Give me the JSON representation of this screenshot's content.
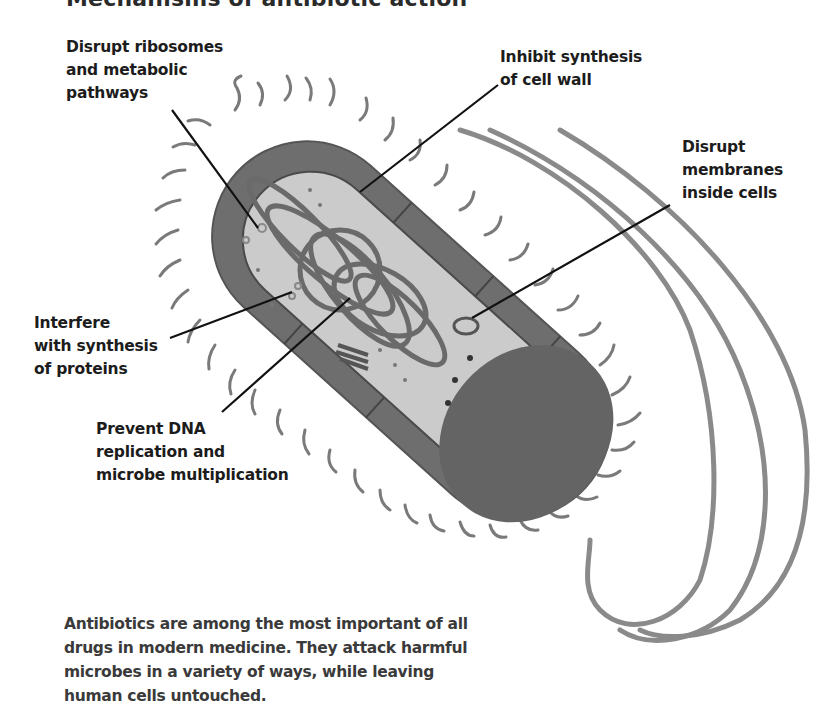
{
  "diagram": {
    "title": "Mechanisms of antibiotic action",
    "labels": [
      {
        "id": "ribosomes",
        "text": "Disrupt ribosomes\nand metabolic\npathways"
      },
      {
        "id": "cell-wall",
        "text": "Inhibit synthesis\nof cell wall"
      },
      {
        "id": "membranes",
        "text": "Disrupt\nmembranes\ninside cells"
      },
      {
        "id": "proteins",
        "text": "Interfere\nwith synthesis\nof proteins"
      },
      {
        "id": "dna",
        "text": "Prevent DNA\nreplication and\nmicrobe multiplication"
      }
    ],
    "caption": "Antibiotics are among the most important of all drugs in modern medicine. They attack harmful microbes in a variety of ways, while leaving human cells untouched.",
    "colors": {
      "background": "#ffffff",
      "cell_wall": "#6e6e6e",
      "cell_wall_dark": "#555555",
      "cytoplasm": "#c9c9c9",
      "dna": "#6a6a6a",
      "pili": "#7a7a7a",
      "flagella": "#8a8a8a",
      "pointer_line": "#111111",
      "text": "#1c1c1c"
    }
  }
}
